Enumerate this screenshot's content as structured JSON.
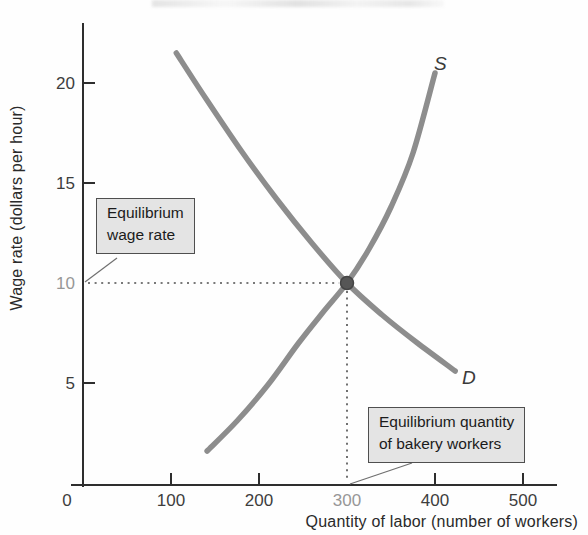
{
  "figure": {
    "background": "#fefefe",
    "axis_color": "#2e2e2e",
    "curve_color": "#8d8d8d",
    "tick_label_color": "#3d3d3d",
    "highlight_label_color": "#979797",
    "box_fill": "#e4e4e4",
    "box_border": "#4f4f4f",
    "dotted_line_color": "#4d4d4d",
    "equilibrium_dot_fill": "#565656",
    "equilibrium_dot_stroke": "#444444"
  },
  "callouts": {
    "wage": {
      "line1": "Equilibrium",
      "line2": "wage rate"
    },
    "quantity": {
      "line1": "Equilibrium quantity",
      "line2": "of bakery workers"
    }
  },
  "chart_data": {
    "type": "line",
    "title": "",
    "xlabel": "Quantity of labor (number of workers)",
    "ylabel": "Wage rate (dollars per hour)",
    "xlim": [
      0,
      540
    ],
    "ylim": [
      0,
      23
    ],
    "grid": false,
    "x_ticks": [
      0,
      100,
      200,
      300,
      400,
      500
    ],
    "y_ticks": [
      5,
      10,
      15,
      20
    ],
    "highlighted_x_tick": 300,
    "highlighted_y_tick": 10,
    "series": [
      {
        "name": "supply",
        "label": "S",
        "points": [
          [
            141,
            1.6
          ],
          [
            175,
            3.1
          ],
          [
            210,
            4.9
          ],
          [
            245,
            7.0
          ],
          [
            272,
            8.5
          ],
          [
            300,
            10.0
          ],
          [
            325,
            11.7
          ],
          [
            350,
            13.8
          ],
          [
            375,
            16.5
          ],
          [
            400,
            20.5
          ]
        ]
      },
      {
        "name": "demand",
        "label": "D",
        "points": [
          [
            106,
            21.5
          ],
          [
            140,
            19.2
          ],
          [
            180,
            16.6
          ],
          [
            220,
            14.2
          ],
          [
            260,
            12.0
          ],
          [
            300,
            10.0
          ],
          [
            340,
            8.4
          ],
          [
            380,
            7.0
          ],
          [
            423,
            5.6
          ]
        ]
      }
    ],
    "equilibrium": {
      "quantity": 300,
      "wage": 10
    }
  }
}
